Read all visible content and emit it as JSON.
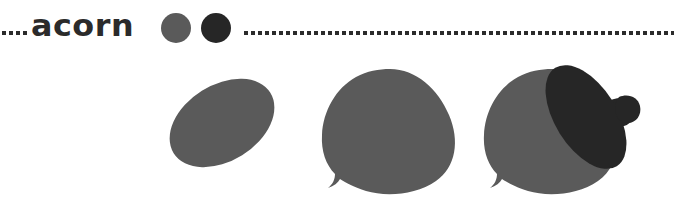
{
  "page": {
    "title": "acorn",
    "background_color": "#ffffff",
    "width": 674,
    "height": 199
  },
  "header": {
    "title": "acorn",
    "rule_style": "dotted",
    "rule_color": "#2b2b2b",
    "dots_left_count": 4,
    "dots_right_count": 62,
    "swatches": [
      {
        "name": "nut-body-color",
        "color": "#5a5a5a"
      },
      {
        "name": "acorn-cap-color",
        "color": "#262626"
      }
    ]
  },
  "palette": {
    "body": "#5a5a5a",
    "cap": "#262626",
    "ink": "#2b2b2b",
    "paper": "#ffffff"
  },
  "steps": [
    {
      "index": "1",
      "label": "tilted-oval",
      "shape": "ellipse",
      "fill": "#5a5a5a",
      "rotation_deg": -32
    },
    {
      "index": "2",
      "label": "nut-body",
      "shape": "acorn-nut",
      "fill": "#5a5a5a",
      "rotation_deg": 0
    },
    {
      "index": "3",
      "label": "nut-with-cap-and-stem",
      "shape": "acorn-complete",
      "fill": "#5a5a5a",
      "cap_fill": "#262626",
      "rotation_deg": 0
    }
  ]
}
